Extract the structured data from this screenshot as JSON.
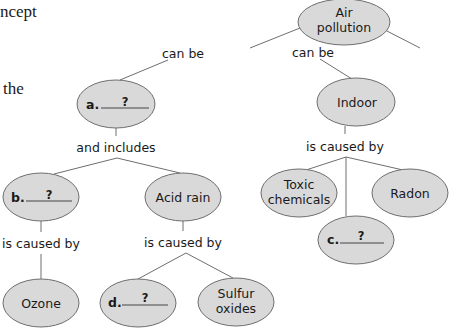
{
  "side_text": {
    "line1": "ncept",
    "line2": "the"
  },
  "colors": {
    "node_fill": "#d9d9d9",
    "node_stroke": "#6e6e6e",
    "line": "#6e6e6e",
    "text": "#1a1a1a"
  },
  "nodes": {
    "air_pollution": {
      "line1": "Air",
      "line2": "pollution"
    },
    "a": {
      "letter": "a.",
      "mark": "?"
    },
    "indoor": {
      "label": "Indoor"
    },
    "b": {
      "letter": "b.",
      "mark": "?"
    },
    "acid_rain": {
      "label": "Acid rain"
    },
    "toxic_chemicals": {
      "line1": "Toxic",
      "line2": "chemicals"
    },
    "radon": {
      "label": "Radon"
    },
    "c": {
      "letter": "c.",
      "mark": "?"
    },
    "ozone": {
      "label": "Ozone"
    },
    "d": {
      "letter": "d.",
      "mark": "?"
    },
    "sulfur_oxides": {
      "line1": "Sulfur",
      "line2": "oxides"
    }
  },
  "links": {
    "can_be_left": "can be",
    "can_be_right": "can be",
    "and_includes": "and includes",
    "is_caused_by_indoor": "is caused by",
    "is_caused_by_b": "is caused by",
    "is_caused_by_acid": "is caused by"
  }
}
